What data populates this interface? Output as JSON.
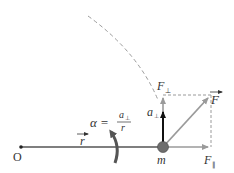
{
  "diagram": {
    "labels": {
      "origin": "O",
      "radius": "r",
      "mass": "m",
      "force": "F",
      "force_perp": "F",
      "force_perp_sub": "⊥",
      "force_par": "F",
      "force_par_sub": "∥",
      "accel": "a",
      "accel_sub": "⊥",
      "alpha_lhs": "α =",
      "alpha_num": "a",
      "alpha_num_sub": "⊥",
      "alpha_den": "r"
    },
    "colors": {
      "radius_line": "#555555",
      "force_vectors": "#9a9a9a",
      "accel_vector": "#111111",
      "dashed": "#9a9a9a",
      "mass_fill": "#6e6e6e",
      "text": "#333333"
    }
  }
}
